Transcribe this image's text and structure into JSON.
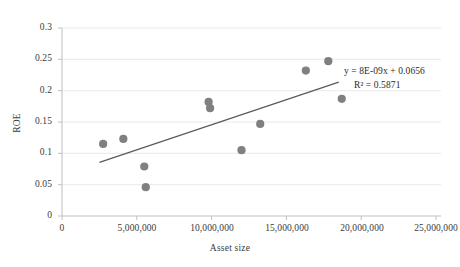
{
  "chart_data": {
    "type": "scatter",
    "title": "",
    "xlabel": "Asset size",
    "ylabel": "ROE",
    "xlim": [
      0,
      25000000
    ],
    "ylim": [
      0,
      0.3
    ],
    "grid": true,
    "legend": "none",
    "xticks": [
      0,
      5000000,
      10000000,
      15000000,
      20000000,
      25000000
    ],
    "xtick_labels": [
      "0",
      "5,000,000",
      "10,000,000",
      "15,000,000",
      "20,000,000",
      "25,000,000"
    ],
    "yticks": [
      0,
      0.05,
      0.1,
      0.15,
      0.2,
      0.25,
      0.3
    ],
    "ytick_labels": [
      "0",
      "0.05",
      "0.1",
      "0.15",
      "0.2",
      "0.25",
      "0.3"
    ],
    "marker_color": "#808080",
    "trendline_color": "#595959",
    "points": [
      {
        "x": 2750000,
        "y": 0.115
      },
      {
        "x": 4100000,
        "y": 0.123
      },
      {
        "x": 5500000,
        "y": 0.079
      },
      {
        "x": 5600000,
        "y": 0.046
      },
      {
        "x": 9800000,
        "y": 0.182
      },
      {
        "x": 9900000,
        "y": 0.172
      },
      {
        "x": 12000000,
        "y": 0.105
      },
      {
        "x": 13250000,
        "y": 0.147
      },
      {
        "x": 16300000,
        "y": 0.232
      },
      {
        "x": 17800000,
        "y": 0.247
      },
      {
        "x": 18700000,
        "y": 0.187
      }
    ],
    "trendline": {
      "slope": 8e-09,
      "intercept": 0.0656,
      "x_start": 2500000,
      "x_end": 18500000
    },
    "annotations": {
      "equation": "y = 8E-09x + 0.0656",
      "r_squared": "R² = 0.5871"
    }
  }
}
